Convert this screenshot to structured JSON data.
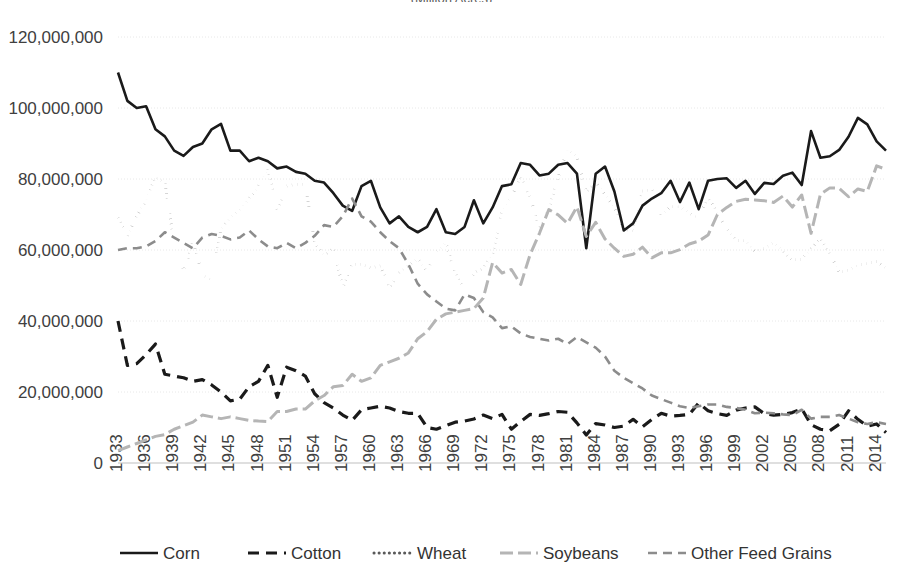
{
  "title_clipped": "(Million Acres)",
  "axes": {
    "y_tick_labels": [
      "120,000,000",
      "100,000,000",
      "80,000,000",
      "60,000,000",
      "40,000,000",
      "20,000,000",
      "0"
    ],
    "y_tick_values": [
      120000000,
      100000000,
      80000000,
      60000000,
      40000000,
      20000000,
      0
    ],
    "x_tick_labels": [
      "1933",
      "1936",
      "1939",
      "1942",
      "1945",
      "1948",
      "1951",
      "1954",
      "1957",
      "1960",
      "1963",
      "1966",
      "1969",
      "1972",
      "1975",
      "1978",
      "1981",
      "1984",
      "1987",
      "1990",
      "1993",
      "1996",
      "1999",
      "2002",
      "2005",
      "2008",
      "2011",
      "2014"
    ]
  },
  "legend": {
    "items": [
      {
        "label": "Corn",
        "key": "corn",
        "swatch": "solid-thick-black"
      },
      {
        "label": "Cotton",
        "key": "cotton",
        "swatch": "dash-thick-black"
      },
      {
        "label": "Wheat",
        "key": "wheat",
        "swatch": "dotted-gray"
      },
      {
        "label": "Soybeans",
        "key": "soybeans",
        "swatch": "solid-lightgray"
      },
      {
        "label": "Other Feed Grains",
        "key": "other_feed_grains",
        "swatch": "dash-gray"
      }
    ]
  },
  "colors": {
    "corn": "#1a1a1a",
    "cotton": "#1a1a1a",
    "wheat": "#595959",
    "soybeans": "#b5b5b5",
    "other_feed_grains": "#8c8c8c",
    "gridline": "#e8e8e8",
    "axis": "#bfbfbf",
    "text": "#404040",
    "background": "#ffffff"
  },
  "chart_data": {
    "type": "line",
    "title": "(Million Acres)",
    "xlabel": "",
    "ylabel": "",
    "xlim": [
      1933,
      2015
    ],
    "ylim": [
      0,
      120000000
    ],
    "grid": true,
    "legend_position": "bottom",
    "x": [
      1933,
      1934,
      1935,
      1936,
      1937,
      1938,
      1939,
      1940,
      1941,
      1942,
      1943,
      1944,
      1945,
      1946,
      1947,
      1948,
      1949,
      1950,
      1951,
      1952,
      1953,
      1954,
      1955,
      1956,
      1957,
      1958,
      1959,
      1960,
      1961,
      1962,
      1963,
      1964,
      1965,
      1966,
      1967,
      1968,
      1969,
      1970,
      1971,
      1972,
      1973,
      1974,
      1975,
      1976,
      1977,
      1978,
      1979,
      1980,
      1981,
      1982,
      1983,
      1984,
      1985,
      1986,
      1987,
      1988,
      1989,
      1990,
      1991,
      1992,
      1993,
      1994,
      1995,
      1996,
      1997,
      1998,
      1999,
      2000,
      2001,
      2002,
      2003,
      2004,
      2005,
      2006,
      2007,
      2008,
      2009,
      2010,
      2011,
      2012,
      2013,
      2014,
      2015
    ],
    "series": [
      {
        "name": "Corn",
        "key": "corn",
        "style": "solid",
        "values": [
          110000000,
          102000000,
          100000000,
          100500000,
          94000000,
          92000000,
          88000000,
          86500000,
          89000000,
          90000000,
          94000000,
          95500000,
          88000000,
          88000000,
          85000000,
          86000000,
          85000000,
          83000000,
          83500000,
          82000000,
          81500000,
          79500000,
          79000000,
          76000000,
          72500000,
          71000000,
          78000000,
          79500000,
          72000000,
          67500000,
          69500000,
          66500000,
          65000000,
          66500000,
          71500000,
          65000000,
          64500000,
          66500000,
          74000000,
          67500000,
          72000000,
          78000000,
          78500000,
          84500000,
          84000000,
          81000000,
          81500000,
          84000000,
          84500000,
          81500000,
          60500000,
          81500000,
          83500000,
          76500000,
          65500000,
          67500000,
          72500000,
          74500000,
          76000000,
          79500000,
          73500000,
          79000000,
          71500000,
          79500000,
          80000000,
          80200000,
          77500000,
          79500000,
          75800000,
          78900000,
          78600000,
          80900000,
          81800000,
          78300000,
          93500000,
          86000000,
          86400000,
          88200000,
          91900000,
          97200000,
          95400000,
          90600000,
          88000000
        ]
      },
      {
        "name": "Cotton",
        "key": "cotton",
        "style": "dashed",
        "values": [
          40000000,
          27500000,
          28000000,
          30500000,
          33500000,
          25000000,
          24500000,
          24000000,
          23000000,
          23500000,
          22000000,
          20000000,
          17500000,
          18000000,
          21500000,
          23000000,
          27500000,
          18500000,
          27000000,
          26000000,
          24500000,
          19500000,
          17000000,
          15500000,
          13500000,
          12000000,
          15000000,
          15500000,
          16000000,
          15500000,
          14500000,
          14000000,
          14000000,
          10000000,
          9500000,
          10500000,
          11500000,
          11800000,
          12400000,
          13500000,
          12500000,
          13700000,
          9500000,
          11700000,
          13700000,
          13400000,
          13900000,
          14500000,
          14300000,
          11300000,
          7900000,
          11100000,
          10700000,
          10000000,
          10400000,
          12300000,
          10200000,
          12300000,
          14000000,
          13200000,
          13400000,
          13700000,
          16900000,
          14700000,
          13900000,
          13400000,
          14900000,
          15500000,
          15800000,
          13900000,
          13500000,
          13700000,
          14200000,
          15300000,
          10800000,
          9500000,
          9100000,
          10900000,
          14700000,
          12300000,
          10400000,
          11000000,
          8600000
        ]
      },
      {
        "name": "Wheat",
        "key": "wheat",
        "style": "dotted",
        "values": [
          69000000,
          64000000,
          69500000,
          74000000,
          80500000,
          79000000,
          62000000,
          53500000,
          62500000,
          53000000,
          51500000,
          66000000,
          69000000,
          71500000,
          74500000,
          78000000,
          83000000,
          71500000,
          78000000,
          78500000,
          78500000,
          62000000,
          58500000,
          60500000,
          49500000,
          56000000,
          56000000,
          55000000,
          55500000,
          49500000,
          53500000,
          55500000,
          57500000,
          54000000,
          59500000,
          62000000,
          53500000,
          48500000,
          53500000,
          54900000,
          59000000,
          71000000,
          74900000,
          80400000,
          75100000,
          66000000,
          71400000,
          80600000,
          88300000,
          86200000,
          76400000,
          79200000,
          75600000,
          72000000,
          65800000,
          65500000,
          76600000,
          77000000,
          69900000,
          72200000,
          72200000,
          70300000,
          69000000,
          75100000,
          70400000,
          65800000,
          62700000,
          62600000,
          59600000,
          60400000,
          62100000,
          59700000,
          57200000,
          57300000,
          60400000,
          63200000,
          59200000,
          53600000,
          54400000,
          55700000,
          56200000,
          56800000,
          55000000
        ]
      },
      {
        "name": "Soybeans",
        "key": "soybeans",
        "style": "solid",
        "values": [
          3500000,
          4500000,
          5500000,
          6500000,
          7500000,
          8000000,
          9500000,
          10500000,
          11500000,
          13500000,
          13000000,
          12500000,
          13000000,
          12500000,
          12000000,
          11800000,
          11700000,
          14500000,
          14500000,
          15200000,
          15200000,
          17500000,
          19000000,
          21500000,
          21800000,
          25000000,
          23000000,
          24000000,
          27500000,
          28500000,
          29500000,
          31000000,
          35000000,
          37000000,
          40500000,
          42000000,
          42500000,
          43000000,
          43500000,
          46500000,
          56500000,
          53500000,
          54500000,
          50300000,
          58700000,
          64700000,
          71400000,
          69900000,
          67500000,
          72200000,
          63800000,
          67800000,
          63100000,
          60500000,
          58200000,
          58800000,
          60800000,
          57800000,
          59200000,
          59200000,
          60100000,
          61700000,
          62500000,
          64200000,
          70000000,
          72000000,
          73700000,
          74300000,
          74100000,
          73900000,
          73400000,
          75200000,
          72100000,
          75500000,
          64700000,
          75700000,
          77500000,
          77400000,
          75000000,
          77200000,
          76500000,
          83700000,
          82700000
        ]
      },
      {
        "name": "Other Feed Grains",
        "key": "other_feed_grains",
        "style": "dashed",
        "values": [
          60000000,
          60500000,
          60500000,
          61000000,
          62500000,
          65000000,
          63500000,
          62000000,
          60500000,
          63500000,
          64500000,
          64000000,
          63000000,
          63500000,
          65500000,
          63000000,
          61000000,
          60500000,
          62000000,
          60500000,
          62000000,
          64000000,
          67000000,
          66500000,
          69500000,
          74500000,
          69500000,
          68000000,
          65000000,
          62500000,
          60500000,
          56000000,
          50500000,
          47500000,
          45500000,
          43500000,
          43000000,
          47500000,
          46500000,
          42500000,
          41000000,
          38000000,
          38500000,
          36500000,
          35500000,
          35000000,
          34500000,
          35000000,
          33500000,
          35500000,
          34000000,
          32500000,
          30000000,
          26000000,
          24000000,
          22500000,
          21000000,
          19000000,
          18000000,
          17000000,
          16000000,
          15500000,
          16000000,
          16500000,
          16500000,
          15800000,
          15500000,
          15000000,
          14000000,
          14200000,
          14000000,
          13700000,
          13500000,
          15000000,
          12500000,
          13000000,
          13000000,
          13500000,
          12500000,
          11500000,
          11000000,
          11500000,
          11000000
        ]
      }
    ]
  }
}
